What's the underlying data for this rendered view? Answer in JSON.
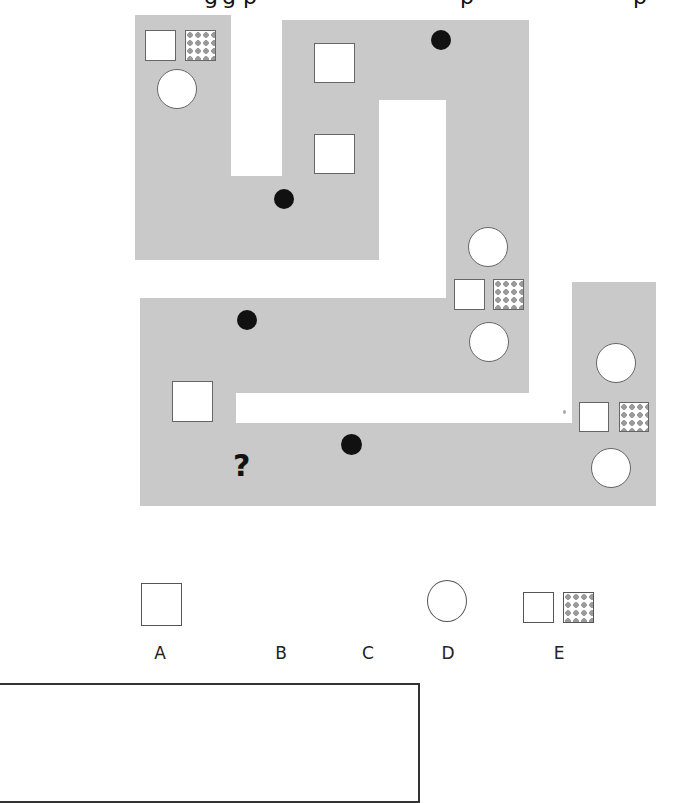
{
  "heading": {
    "clipped_text_fragments": [
      "g",
      "g",
      "p",
      "p",
      "p"
    ]
  },
  "puzzle": {
    "description": "Symbol path sequence puzzle on gray winding track",
    "colors": {
      "track": "#c9c9c9",
      "outline": "#666666",
      "fill": "#ffffff",
      "solid": "#111111"
    },
    "sequence_pattern": [
      "square",
      "six-point-star",
      "small-star-with-dot",
      "large-star",
      "small-star",
      "striped-four-point-star",
      "black-four-point-star",
      "circle",
      "square-pair",
      "triangle"
    ],
    "missing_marker": "?"
  },
  "options": [
    {
      "letter": "A",
      "shape": "square"
    },
    {
      "letter": "B",
      "shape": "six-point-star"
    },
    {
      "letter": "C",
      "shape": "small-five-point-star"
    },
    {
      "letter": "D",
      "shape": "circle"
    },
    {
      "letter": "E",
      "shape": "square-pair (plain + dotted)"
    }
  ],
  "answer_box": {
    "value": ""
  }
}
